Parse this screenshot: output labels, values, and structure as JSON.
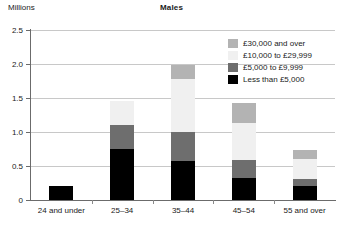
{
  "units_label": "Millions",
  "title": "Males",
  "axis": {
    "y_ticks": [
      "0",
      "0.5",
      "1.0",
      "1.5",
      "2.0",
      "2.5"
    ],
    "y_min": 0,
    "y_max": 2.5
  },
  "legend": {
    "items": [
      {
        "label": "£30,000 and over",
        "color": "#b3b3b3"
      },
      {
        "label": "£10,000 to £29,999",
        "color": "#f0f0f0"
      },
      {
        "label": "£5,000 to £9,999",
        "color": "#6e6e6e"
      },
      {
        "label": "Less than £5,000",
        "color": "#000000"
      }
    ]
  },
  "chart_data": {
    "type": "bar",
    "title": "Males",
    "xlabel": "",
    "ylabel": "Millions",
    "ylim": [
      0,
      2.5
    ],
    "yticks": [
      0,
      0.5,
      1.0,
      1.5,
      2.0,
      2.5
    ],
    "grid": true,
    "stacked": true,
    "legend_position": "top-right",
    "categories": [
      "24 and under",
      "25–34",
      "35–44",
      "45–54",
      "55 and over"
    ],
    "series": [
      {
        "name": "Less than £5,000",
        "color": "#000000",
        "values": [
          0.21,
          0.75,
          0.57,
          0.33,
          0.2
        ]
      },
      {
        "name": "£5,000 to £9,999",
        "color": "#6e6e6e",
        "values": [
          0.0,
          0.36,
          0.43,
          0.26,
          0.11
        ]
      },
      {
        "name": "£10,000 to £29,999",
        "color": "#f0f0f0",
        "values": [
          0.0,
          0.35,
          0.78,
          0.54,
          0.3
        ]
      },
      {
        "name": "£30,000 and over",
        "color": "#b3b3b3",
        "values": [
          0.0,
          0.0,
          0.21,
          0.3,
          0.12
        ]
      }
    ],
    "totals": [
      0.21,
      1.46,
      1.99,
      1.43,
      0.73
    ]
  }
}
